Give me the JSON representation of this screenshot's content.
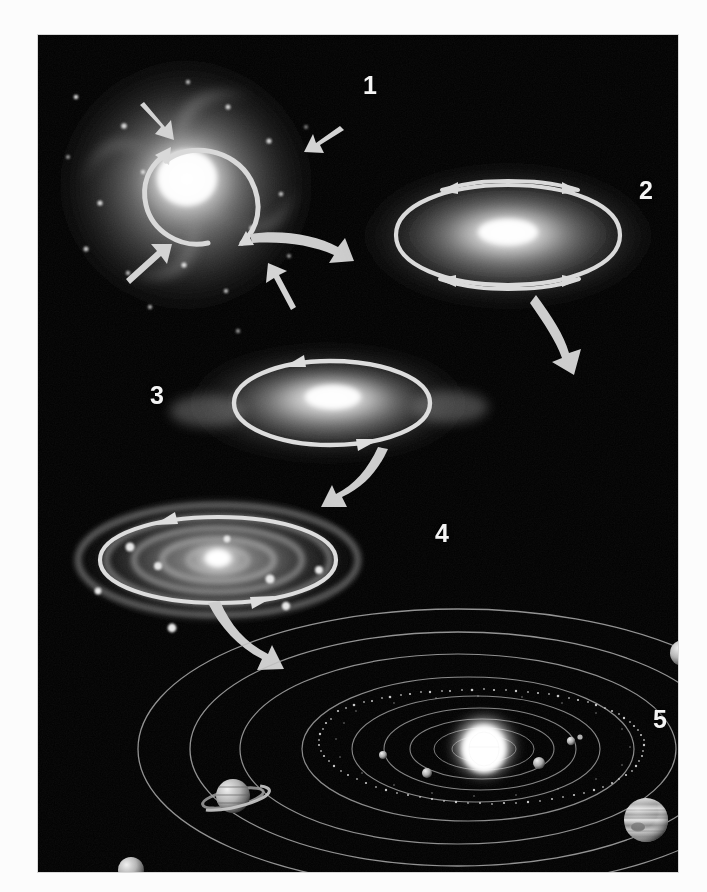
{
  "figure": {
    "title": "Nebular hypothesis: formation of the solar system",
    "alt": "Five-stage diagram showing a collapsing rotating gas cloud flattening into a disk that condenses into planets orbiting a central star",
    "background_color": "#000000",
    "plate_border_color": "#d8d8d8",
    "label_color": "#f4f4f4",
    "arrow_color": "#cfcfcf",
    "orbit_color": "#b9b9b9"
  },
  "stages": [
    {
      "number": "1",
      "name": "collapsing-nebula",
      "caption": "Rotating cloud of gas and dust contracts under gravity",
      "motion_arrows": 5,
      "rotation_arrows": 2
    },
    {
      "number": "2",
      "name": "flattening-cloud",
      "caption": "Contraction speeds rotation and the cloud flattens",
      "motion_arrows": 0,
      "rotation_arrows": 4
    },
    {
      "number": "3",
      "name": "protoplanetary-disk",
      "caption": "A spinning disk forms with a dense hot center",
      "motion_arrows": 0,
      "rotation_arrows": 2
    },
    {
      "number": "4",
      "name": "condensing-rings",
      "caption": "Material condenses into rings and protoplanets",
      "motion_arrows": 0,
      "rotation_arrows": 2
    },
    {
      "number": "5",
      "name": "solar-system",
      "caption": "The finished solar system with sun, planets and asteroid belt",
      "motion_arrows": 0,
      "rotation_arrows": 0
    }
  ],
  "transitions": [
    {
      "name": "arrow-stage-1-to-2",
      "from": "1",
      "to": "2"
    },
    {
      "name": "arrow-stage-2-to-3",
      "from": "2",
      "to": "3"
    },
    {
      "name": "arrow-stage-3-to-4",
      "from": "3",
      "to": "4"
    },
    {
      "name": "arrow-stage-4-to-5",
      "from": "4",
      "to": "5"
    }
  ],
  "solar_system": {
    "star_name": "sun",
    "orbit_count": 9,
    "asteroid_belt": true,
    "bodies": [
      {
        "name": "sun",
        "cx": 446,
        "cy": 714,
        "r": 22
      },
      {
        "name": "inner-planet-1",
        "cx": 389,
        "cy": 738,
        "r": 5
      },
      {
        "name": "inner-planet-2",
        "cx": 345,
        "cy": 720,
        "r": 4
      },
      {
        "name": "inner-planet-3",
        "cx": 501,
        "cy": 728,
        "r": 6
      },
      {
        "name": "inner-planet-4",
        "cx": 533,
        "cy": 706,
        "r": 4
      },
      {
        "name": "saturn",
        "cx": 195,
        "cy": 761,
        "r": 17
      },
      {
        "name": "jupiter",
        "cx": 608,
        "cy": 785,
        "r": 22
      },
      {
        "name": "uranus",
        "cx": 645,
        "cy": 618,
        "r": 13
      },
      {
        "name": "neptune",
        "cx": 93,
        "cy": 835,
        "r": 13
      }
    ]
  }
}
